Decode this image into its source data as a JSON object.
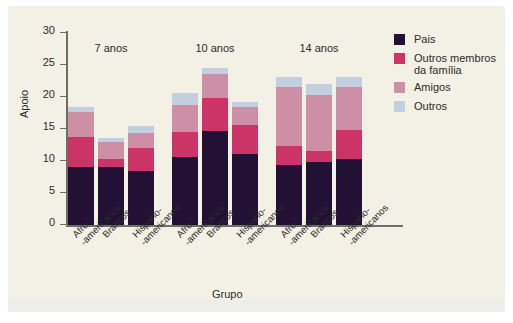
{
  "chart_data": {
    "type": "bar",
    "subtype": "stacked-grouped",
    "title": "",
    "xlabel": "Grupo",
    "ylabel": "Apoio",
    "ylim": [
      0,
      30
    ],
    "yticks": [
      0,
      5,
      10,
      15,
      20,
      25,
      30
    ],
    "ytick_labels": [
      "0",
      "5",
      "10",
      "15",
      "20",
      "25",
      "30"
    ],
    "grid": false,
    "legend_position": "right",
    "group_titles": [
      "7 anos",
      "10 anos",
      "14 anos"
    ],
    "categories": [
      "Afro--americanos",
      "Brancos",
      "Hispano--americanos",
      "Afro--americanos",
      "Brancos",
      "Hispano--americanos",
      "Afro--americanos",
      "Brancos",
      "Hispano--americanos"
    ],
    "category_lines": [
      [
        "Afro-",
        "-americanos"
      ],
      [
        "Brancos",
        ""
      ],
      [
        "Hispano-",
        "-americanos"
      ],
      [
        "Afro-",
        "-americanos"
      ],
      [
        "Brancos",
        ""
      ],
      [
        "Hispano-",
        "-americanos"
      ],
      [
        "Afro-",
        "-americanos"
      ],
      [
        "Brancos",
        ""
      ],
      [
        "Hispano-",
        "-americanos"
      ]
    ],
    "series": [
      {
        "name": "Pais",
        "color": "#231135",
        "values": [
          9.0,
          9.1,
          8.4,
          10.7,
          14.7,
          11.1,
          9.3,
          9.9,
          10.3
        ]
      },
      {
        "name": "Outros membros da família",
        "color": "#cc3366",
        "values": [
          4.8,
          1.2,
          3.7,
          3.8,
          5.2,
          4.6,
          3.0,
          1.7,
          4.5
        ]
      },
      {
        "name": "Amigos",
        "color": "#cc8fa6",
        "values": [
          3.9,
          2.7,
          2.3,
          4.3,
          3.7,
          2.7,
          9.2,
          8.7,
          6.7
        ]
      },
      {
        "name": "Outros",
        "color": "#c3cfdf",
        "values": [
          0.7,
          0.6,
          1.1,
          1.8,
          0.9,
          0.9,
          1.6,
          1.7,
          1.6
        ]
      }
    ],
    "totals": [
      18.4,
      13.6,
      15.5,
      20.6,
      24.5,
      19.3,
      23.1,
      22.0,
      23.1
    ]
  },
  "legend": {
    "entries": [
      {
        "label": "Pais",
        "label_line2": "",
        "color": "#231135"
      },
      {
        "label": "Outros membros",
        "label_line2": "da família",
        "color": "#cc3366"
      },
      {
        "label": "Amigos",
        "label_line2": "",
        "color": "#cc8fa6"
      },
      {
        "label": "Outros",
        "label_line2": "",
        "color": "#c3cfdf"
      }
    ]
  },
  "colors": {
    "background": "#f3f1e6",
    "axis": "#6f6d66",
    "text": "#2b2b2b"
  }
}
